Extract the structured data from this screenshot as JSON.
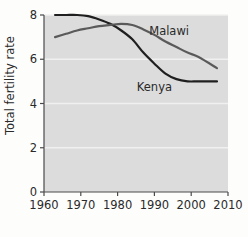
{
  "chart_data": {
    "type": "line",
    "title": "",
    "subtitle": "",
    "xlabel": "",
    "ylabel": "Total fertility rate",
    "xlim": [
      1960,
      2010
    ],
    "ylim": [
      0,
      8
    ],
    "xticks": [
      "1960",
      "1970",
      "1980",
      "1990",
      "2000",
      "2010"
    ],
    "xtick_values": [
      1960,
      1970,
      1980,
      1990,
      2000,
      2010
    ],
    "yticks": [
      "0",
      "2",
      "4",
      "6",
      "8"
    ],
    "ytick_values": [
      0,
      2,
      4,
      6,
      8
    ],
    "grid": "horizontal-light",
    "legend": "inline-labels",
    "plot_background": "#dcdcdc",
    "series": [
      {
        "name": "Kenya",
        "color": "#1f1f1f",
        "label_x": 1990,
        "label_y": 4.55,
        "x": [
          1963,
          1966,
          1969,
          1972,
          1975,
          1978,
          1981,
          1984,
          1987,
          1990,
          1993,
          1996,
          1999,
          2002,
          2007
        ],
        "values": [
          8.0,
          8.0,
          8.0,
          7.95,
          7.8,
          7.6,
          7.3,
          6.9,
          6.3,
          5.8,
          5.35,
          5.1,
          5.0,
          5.0,
          5.0
        ]
      },
      {
        "name": "Malawi",
        "color": "#5a5a5a",
        "label_x": 1994,
        "label_y": 7.1,
        "x": [
          1963,
          1966,
          1969,
          1972,
          1975,
          1978,
          1981,
          1984,
          1987,
          1990,
          1993,
          1996,
          1999,
          2002,
          2007
        ],
        "values": [
          7.0,
          7.15,
          7.3,
          7.4,
          7.5,
          7.55,
          7.6,
          7.55,
          7.35,
          7.1,
          6.8,
          6.55,
          6.3,
          6.1,
          5.6
        ]
      }
    ]
  }
}
